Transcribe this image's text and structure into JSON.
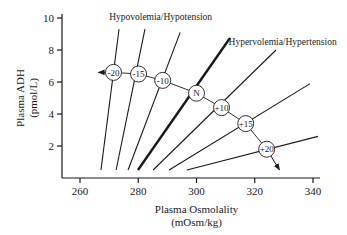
{
  "chart_data": {
    "type": "line",
    "title": "",
    "xlabel": "Plasma Osmolality (mOsm/kg)",
    "xlabel_lines": [
      "Plasma Osmolality",
      "(mOsm/kg)"
    ],
    "ylabel": "Plasma ADH (pmol/L)",
    "ylabel_lines": [
      "Plasma ADH",
      "(pmol/L)"
    ],
    "xlim": [
      255,
      345
    ],
    "ylim": [
      0,
      10.5
    ],
    "xticks": [
      260,
      280,
      300,
      320,
      340
    ],
    "yticks": [
      2,
      4,
      6,
      8,
      10
    ],
    "grid": false,
    "legend": "none",
    "annotations": [
      {
        "text": "Hypovolemia/Hypotension",
        "x": 270,
        "y": 9.9
      },
      {
        "text": "Hypervolemia/Hypertension",
        "x": 311,
        "y": 8.3
      }
    ],
    "series": [
      {
        "name": "-20",
        "x": [
          267.2,
          273.4
        ],
        "y": [
          0.5,
          9.3
        ],
        "thick": false
      },
      {
        "name": "-15",
        "x": [
          272.4,
          282.3
        ],
        "y": [
          0.5,
          9.3
        ],
        "thick": false
      },
      {
        "name": "-10",
        "x": [
          276.5,
          294.4
        ],
        "y": [
          0.5,
          9.1
        ],
        "thick": false
      },
      {
        "name": "N",
        "x": [
          279.9,
          311.5
        ],
        "y": [
          0.5,
          8.75
        ],
        "thick": true
      },
      {
        "name": "+10",
        "x": [
          285.1,
          327.3
        ],
        "y": [
          0.5,
          8.0
        ],
        "thick": false
      },
      {
        "name": "+15",
        "x": [
          290.6,
          339.0
        ],
        "y": [
          0.5,
          5.9
        ],
        "thick": false
      },
      {
        "name": "+20",
        "x": [
          296.7,
          341.7
        ],
        "y": [
          0.5,
          2.6
        ],
        "thick": false
      }
    ],
    "markers": [
      {
        "label": "-20",
        "x": 271.5,
        "y": 6.6
      },
      {
        "label": "-15",
        "x": 280.1,
        "y": 6.5
      },
      {
        "label": "-10",
        "x": 288.4,
        "y": 6.1
      },
      {
        "label": "N",
        "x": 300.0,
        "y": 5.3
      },
      {
        "label": "+10",
        "x": 308.6,
        "y": 4.4
      },
      {
        "label": "+15",
        "x": 316.9,
        "y": 3.4
      },
      {
        "label": "+20",
        "x": 324.1,
        "y": 1.8
      }
    ],
    "arrows": [
      {
        "from": [
          271.5,
          6.6
        ],
        "to": [
          266.3,
          6.6
        ],
        "direction": "left"
      },
      {
        "from": [
          324.1,
          1.8
        ],
        "to": [
          328.5,
          0.5
        ],
        "direction": "down-right"
      }
    ],
    "colors": {
      "line": "#1a1a1a",
      "marker_fill": "#ffffff",
      "axis": "#1a1a1a"
    }
  }
}
